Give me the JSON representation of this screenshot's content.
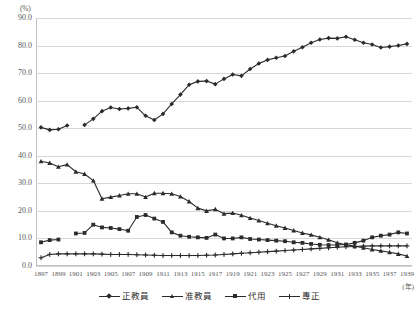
{
  "chart_data": {
    "type": "line",
    "title": "",
    "xlabel": "(年)",
    "ylabel": "(%)",
    "ylim": [
      0,
      90
    ],
    "ytick_step": 10,
    "yticks": [
      "90.0",
      "80.0",
      "70.0",
      "60.0",
      "50.0",
      "40.0",
      "30.0",
      "20.0",
      "10.0",
      "0.0"
    ],
    "grid": true,
    "legend_position": "bottom",
    "x": [
      1897,
      1898,
      1899,
      1900,
      1901,
      1902,
      1903,
      1904,
      1905,
      1906,
      1907,
      1908,
      1909,
      1910,
      1911,
      1912,
      1913,
      1914,
      1915,
      1916,
      1917,
      1918,
      1919,
      1920,
      1921,
      1922,
      1923,
      1924,
      1925,
      1926,
      1927,
      1928,
      1929,
      1930,
      1931,
      1932,
      1933,
      1934,
      1935,
      1936,
      1937,
      1938,
      1939
    ],
    "xticks": [
      "1897",
      "1899",
      "1901",
      "1903",
      "1905",
      "1907",
      "1909",
      "1911",
      "1913",
      "1915",
      "1917",
      "1919",
      "1921",
      "1923",
      "1925",
      "1927",
      "1929",
      "1931",
      "1933",
      "1935",
      "1937",
      "1939"
    ],
    "series": [
      {
        "name": "正教員",
        "marker": "diamond",
        "values": [
          50.3,
          49.4,
          49.6,
          51.0,
          null,
          51.2,
          53.4,
          56.2,
          57.5,
          57.0,
          57.2,
          57.6,
          54.5,
          53.0,
          55.2,
          58.8,
          62.2,
          65.8,
          67.0,
          67.1,
          66.0,
          67.9,
          69.5,
          69.0,
          71.5,
          73.5,
          74.8,
          75.6,
          76.2,
          77.9,
          79.4,
          81.0,
          82.2,
          82.7,
          82.6,
          83.2,
          82.1,
          81.0,
          80.4,
          79.3,
          79.6,
          80.0,
          80.6
        ]
      },
      {
        "name": "准教員",
        "marker": "triangle",
        "values": [
          38.0,
          37.4,
          36.0,
          36.8,
          34.2,
          33.4,
          31.0,
          24.4,
          25.0,
          25.6,
          26.2,
          26.2,
          25.0,
          26.4,
          26.4,
          26.2,
          25.2,
          23.4,
          21.0,
          20.0,
          20.6,
          19.0,
          19.2,
          18.4,
          17.4,
          16.5,
          15.5,
          14.6,
          13.8,
          12.9,
          12.0,
          11.3,
          10.4,
          9.5,
          8.4,
          7.7,
          7.2,
          6.6,
          6.0,
          5.5,
          5.0,
          4.4,
          3.6
        ]
      },
      {
        "name": "代用",
        "marker": "square",
        "values": [
          8.6,
          9.4,
          9.6,
          null,
          11.8,
          12.0,
          15.0,
          14.0,
          13.8,
          13.4,
          12.8,
          17.8,
          18.5,
          17.2,
          16.0,
          12.2,
          11.0,
          10.6,
          10.4,
          10.2,
          11.4,
          10.0,
          10.0,
          10.4,
          9.8,
          9.6,
          9.4,
          9.2,
          9.0,
          8.6,
          8.4,
          8.0,
          7.7,
          7.6,
          7.6,
          7.8,
          8.4,
          9.2,
          10.4,
          11.0,
          11.4,
          12.2,
          11.8
        ]
      },
      {
        "name": "專正",
        "marker": "plus",
        "values": [
          3.0,
          4.2,
          4.4,
          4.4,
          4.4,
          4.4,
          4.4,
          4.3,
          4.2,
          4.2,
          4.2,
          4.1,
          4.0,
          3.9,
          3.8,
          3.8,
          3.8,
          3.8,
          3.8,
          3.9,
          4.0,
          4.2,
          4.4,
          4.6,
          4.8,
          5.0,
          5.2,
          5.4,
          5.6,
          5.8,
          6.0,
          6.2,
          6.4,
          6.6,
          6.8,
          7.0,
          7.1,
          7.2,
          7.3,
          7.3,
          7.3,
          7.3,
          7.3
        ]
      }
    ]
  },
  "legend": {
    "items": [
      {
        "label": "正教員",
        "marker": "diamond"
      },
      {
        "label": "准教員",
        "marker": "triangle"
      },
      {
        "label": "代用",
        "marker": "square"
      },
      {
        "label": "專正",
        "marker": "plus"
      }
    ]
  },
  "colors": {
    "line": "#2b2b2b",
    "grid": "#d8d8d8",
    "axis": "#bfbfbf",
    "text": "#595959"
  }
}
